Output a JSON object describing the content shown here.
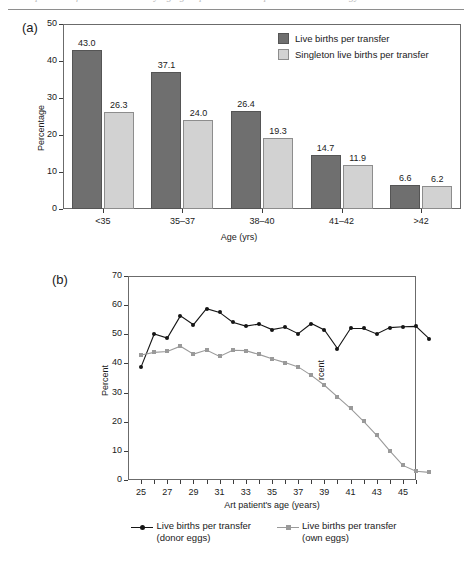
{
  "page": {
    "ghost_header": "comparison of live birth rates by age group in assisted reproductive technology"
  },
  "chart_data": [
    {
      "type": "bar",
      "panel": "(a)",
      "title": "",
      "xlabel": "Age (yrs)",
      "ylabel": "Percentage",
      "ylim": [
        0,
        50
      ],
      "yticks": [
        0,
        10,
        20,
        30,
        40,
        50
      ],
      "grid": false,
      "legend_position": "top-right",
      "categories": [
        "<35",
        "35–37",
        "38–40",
        "41–42",
        ">42"
      ],
      "series": [
        {
          "name": "Live births per transfer",
          "color": "#6f6f6f",
          "values": [
            43.0,
            37.1,
            26.4,
            14.7,
            6.6
          ],
          "labels": [
            "43.0",
            "37.1",
            "26.4",
            "14.7",
            "6.6"
          ]
        },
        {
          "name": "Singleton live births per transfer",
          "color": "#d2d2d2",
          "values": [
            26.3,
            24.0,
            19.3,
            11.9,
            6.2
          ],
          "labels": [
            "26.3",
            "24.0",
            "19.3",
            "11.9",
            "6.2"
          ]
        }
      ]
    },
    {
      "type": "line",
      "panel": "(b)",
      "title": "",
      "xlabel": "Art patient's age (years)",
      "ylabel": "Percent",
      "ylim": [
        0,
        70
      ],
      "yticks": [
        0,
        10,
        20,
        30,
        40,
        50,
        60,
        70
      ],
      "xlim": [
        24,
        46
      ],
      "xticks": [
        25,
        27,
        29,
        31,
        33,
        35,
        37,
        39,
        41,
        43,
        45
      ],
      "x": [
        25,
        26,
        27,
        28,
        29,
        30,
        31,
        32,
        33,
        34,
        35,
        36,
        37,
        38,
        39,
        40,
        41,
        42,
        43,
        44,
        45,
        46
      ],
      "grid": false,
      "legend_position": "bottom",
      "annotation": "rcent",
      "series": [
        {
          "name": "Live births per transfer (donor eggs)",
          "color": "#151515",
          "marker": "circle",
          "values": [
            38.8,
            50.1,
            48.7,
            56.3,
            53.3,
            58.8,
            57.5,
            54.1,
            52.8,
            53.5,
            51.6,
            52.4,
            50.2,
            53.7,
            51.5,
            45.1,
            52.0,
            52.0,
            50.1,
            52.3,
            52.6,
            52.7,
            48.5
          ]
        },
        {
          "name": "Live births per transfer (own eggs)",
          "color": "#9a9a9a",
          "marker": "square",
          "values": [
            42.9,
            43.8,
            44.1,
            45.9,
            43.2,
            44.6,
            42.4,
            44.5,
            44.4,
            43.1,
            41.6,
            40.3,
            38.8,
            35.9,
            32.5,
            28.5,
            24.6,
            20.1,
            15.3,
            10.0,
            5.0,
            3.0,
            2.6
          ]
        }
      ]
    }
  ],
  "chart_a": {
    "panel_label": "(a)",
    "ylabel": "Percentage",
    "xlabel": "Age (yrs)",
    "yticks": [
      "50",
      "40",
      "30",
      "20",
      "10",
      "0"
    ],
    "xticks": [
      "<35",
      "35–37",
      "38–40",
      "41–42",
      ">42"
    ],
    "legend": [
      {
        "label": "Live births per transfer",
        "swatch": "dark"
      },
      {
        "label": "Singleton live births per transfer",
        "swatch": "light"
      }
    ]
  },
  "chart_b": {
    "panel_label": "(b)",
    "ylabel": "Percent",
    "xlabel": "Art patient's age (years)",
    "yticks": [
      "70",
      "60",
      "50",
      "40",
      "30",
      "20",
      "10",
      "0"
    ],
    "xticks": [
      "25",
      "27",
      "29",
      "31",
      "33",
      "35",
      "37",
      "39",
      "41",
      "43",
      "45"
    ],
    "stray_text": "rcent",
    "legend": [
      {
        "line1": "Live births per transfer",
        "line2": "(donor eggs)",
        "mark": "donor"
      },
      {
        "line1": "Live births per transfer",
        "line2": "(own eggs)",
        "mark": "own"
      }
    ]
  },
  "colors": {
    "dark_bar": "#6f6f6f",
    "light_bar": "#d2d2d2",
    "donor_line": "#151515",
    "own_line": "#9a9a9a",
    "frame": "#6b6b6b"
  }
}
